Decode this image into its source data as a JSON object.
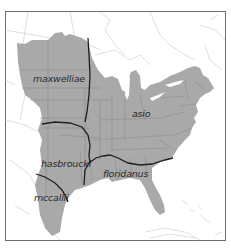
{
  "map": {
    "subject": "Eastern Screech-Owl subspecies ranges",
    "colors": {
      "background": "#ffffff",
      "range_fill": "#a9a9a9",
      "state_border": "#8c8c8c",
      "outline_land": "#c8c8c8",
      "subspecies_boundary": "#1e1e1e",
      "frame": "#6e6e6e",
      "label": "#2a2a2a"
    },
    "labels": [
      {
        "id": "maxwelliae",
        "text": "maxwelliae",
        "x": 33,
        "y": 82
      },
      {
        "id": "asio",
        "text": "asio",
        "x": 132,
        "y": 117
      },
      {
        "id": "hasbrouckii",
        "text": "hasbroucki",
        "x": 41,
        "y": 167
      },
      {
        "id": "floridanus",
        "text": "floridanus",
        "x": 103,
        "y": 177
      },
      {
        "id": "mccallii",
        "text": "mccallii",
        "x": 34,
        "y": 201
      }
    ]
  }
}
